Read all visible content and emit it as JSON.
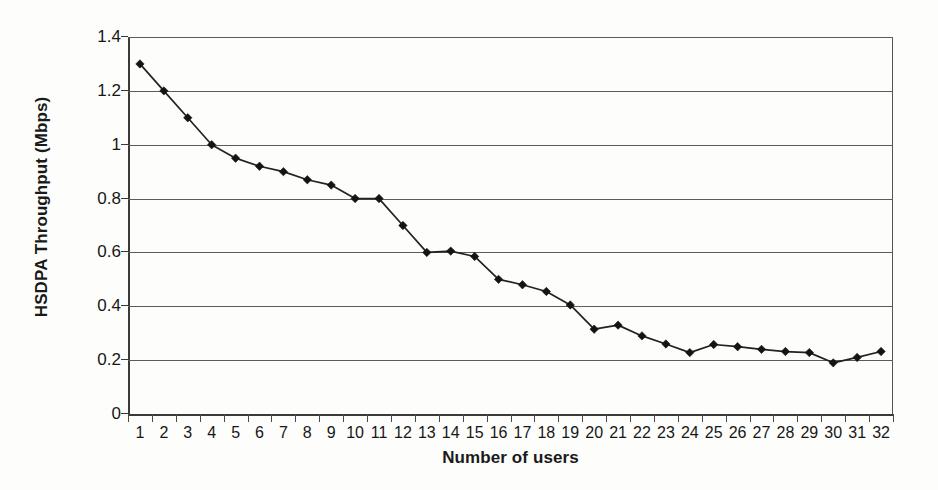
{
  "chart_data": {
    "type": "line",
    "title": "",
    "xlabel": "Number of users",
    "ylabel": "HSDPA Throughput (Mbps)",
    "xlim": [
      0,
      32
    ],
    "ylim": [
      0,
      1.4
    ],
    "grid": true,
    "legend": "none",
    "marker": "diamond",
    "line_color": "#222222",
    "marker_color": "#141414",
    "gridline_color": "#5b5b5b",
    "background_color": "#fdfdfb",
    "y_ticks": [
      0,
      0.2,
      0.4,
      0.6,
      0.8,
      1,
      1.2,
      1.4
    ],
    "y_tick_labels": [
      "0",
      "0.2",
      "0.4",
      "0.6",
      "0.8",
      "1",
      "1.2",
      "1.4"
    ],
    "categories": [
      1,
      2,
      3,
      4,
      5,
      6,
      7,
      8,
      9,
      10,
      11,
      12,
      13,
      14,
      15,
      16,
      17,
      18,
      19,
      20,
      21,
      22,
      23,
      24,
      25,
      26,
      27,
      28,
      29,
      30,
      31,
      32
    ],
    "x_tick_labels": [
      "1",
      "2",
      "3",
      "4",
      "5",
      "6",
      "7",
      "8",
      "9",
      "10",
      "11",
      "12",
      "13",
      "14",
      "15",
      "16",
      "17",
      "18",
      "19",
      "20",
      "21",
      "22",
      "23",
      "24",
      "25",
      "26",
      "27",
      "28",
      "29",
      "30",
      "31",
      "32"
    ],
    "series": [
      {
        "name": "HSDPA Throughput",
        "values": [
          1.3,
          1.2,
          1.1,
          1.0,
          0.95,
          0.92,
          0.9,
          0.87,
          0.85,
          0.8,
          0.8,
          0.7,
          0.6,
          0.605,
          0.585,
          0.5,
          0.48,
          0.455,
          0.405,
          0.315,
          0.33,
          0.29,
          0.26,
          0.228,
          0.258,
          0.25,
          0.24,
          0.232,
          0.228,
          0.19,
          0.21,
          0.232
        ]
      }
    ]
  }
}
